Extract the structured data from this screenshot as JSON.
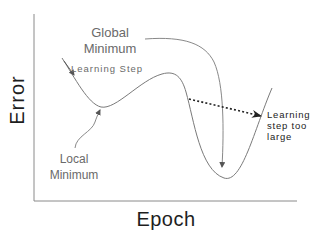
{
  "diagram": {
    "axes": {
      "x_label": "Epoch",
      "y_label": "Error"
    },
    "labels": {
      "global_minimum_line1": "Global",
      "global_minimum_line2": "Minimum",
      "local_minimum_line1": "Local",
      "local_minimum_line2": "Minimum",
      "learning_step": "Learning Step",
      "step_too_large_line1": "Learning",
      "step_too_large_line2": "step too",
      "step_too_large_line3": "large"
    },
    "colors": {
      "curve": "#7a7a7a",
      "axis": "#8a8a8a",
      "label_gray": "#6a6a6a",
      "label_dark": "#222222",
      "arrow": "#222222"
    }
  }
}
